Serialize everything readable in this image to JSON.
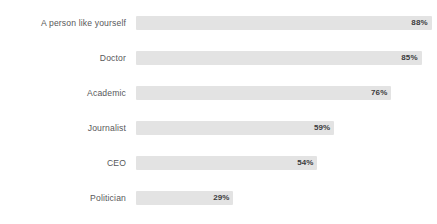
{
  "chart_data": {
    "type": "bar",
    "orientation": "horizontal",
    "title": "",
    "subtitle": "",
    "xlabel": "",
    "ylabel": "",
    "xlim": [
      0,
      100
    ],
    "grid": false,
    "legend": null,
    "value_suffix": "%",
    "categories": [
      "A person like yourself",
      "Doctor",
      "Academic",
      "Journalist",
      "CEO",
      "Politician"
    ],
    "values": [
      88,
      85,
      76,
      59,
      54,
      29
    ],
    "value_labels": [
      "88%",
      "85%",
      "76%",
      "59%",
      "54%",
      "29%"
    ],
    "bars": [
      {
        "category": "A person like yourself",
        "value": 88,
        "label": "88%"
      },
      {
        "category": "Doctor",
        "value": 85,
        "label": "85%"
      },
      {
        "category": "Academic",
        "value": 76,
        "label": "76%"
      },
      {
        "category": "Journalist",
        "value": 59,
        "label": "59%"
      },
      {
        "category": "CEO",
        "value": 54,
        "label": "54%"
      },
      {
        "category": "Politician",
        "value": 29,
        "label": "29%"
      }
    ]
  },
  "style": {
    "bar_color": "#e3e3e3",
    "label_color": "#58585a",
    "value_color": "#3b3b3d",
    "background": "#ffffff"
  },
  "geometry": {
    "bar_origin_x": 136,
    "full_scale_px": 336,
    "label_column_width": 126,
    "row_pitch": 35,
    "first_row_top": 16,
    "bar_height": 14
  }
}
